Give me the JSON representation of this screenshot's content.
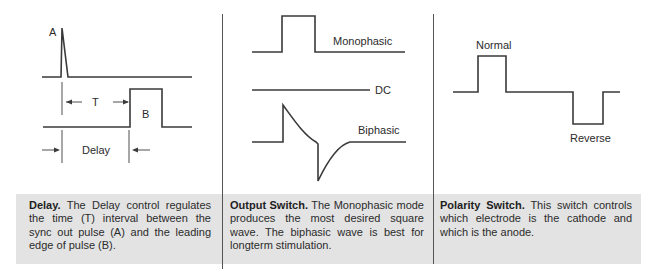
{
  "panels": [
    {
      "id": "delay",
      "labels": {
        "pulse_a": "A",
        "interval": "T",
        "pulse_b": "B",
        "delay": "Delay"
      },
      "caption": {
        "title": "Delay.",
        "body": "The Delay control regulates the time (T) interval between the sync out pulse (A) and the leading edge of pulse (B)."
      }
    },
    {
      "id": "output-switch",
      "labels": {
        "monophasic": "Monophasic",
        "dc": "DC",
        "biphasic": "Biphasic"
      },
      "caption": {
        "title": "Output Switch.",
        "body": "The Monophasic mode produces the most desired square wave. The biphasic wave is best for longterm stimulation."
      }
    },
    {
      "id": "polarity-switch",
      "labels": {
        "normal": "Normal",
        "reverse": "Reverse"
      },
      "caption": {
        "title": "Polarity Switch.",
        "body": "This switch controls which electrode is the cathode and which is the anode."
      }
    }
  ],
  "colors": {
    "caption_background": "#e3e3e3",
    "line": "#3a3a3a",
    "divider": "#555555"
  }
}
